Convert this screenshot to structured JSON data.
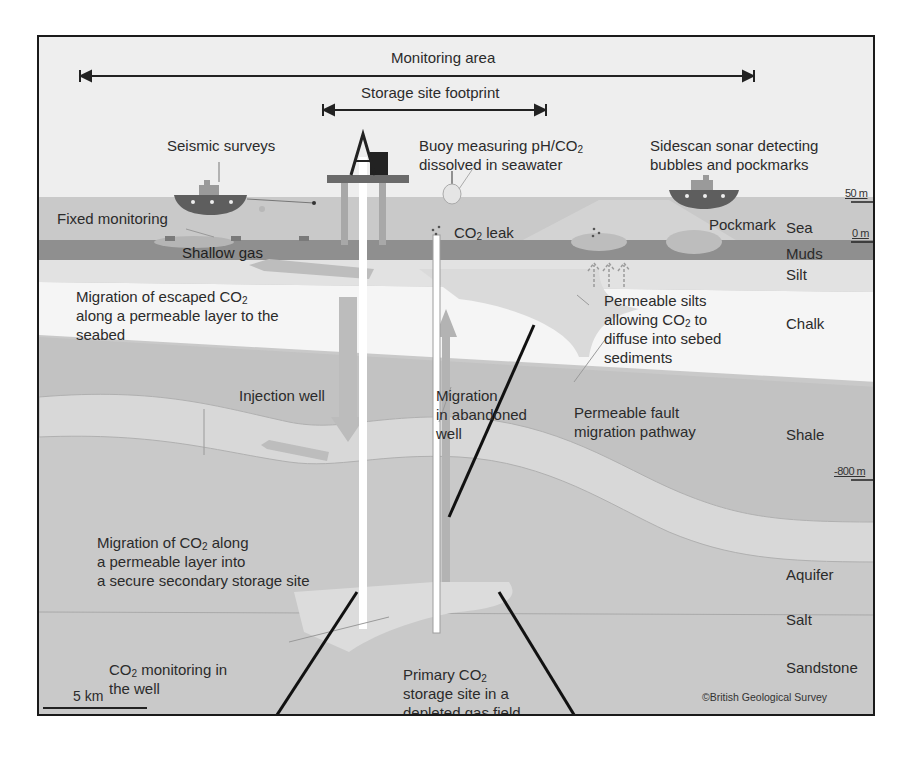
{
  "diagram": {
    "spans": [
      {
        "id": "monitoring-area",
        "label": "Monitoring area"
      },
      {
        "id": "storage-footprint",
        "label": "Storage site footprint"
      }
    ],
    "callouts": {
      "seismic": "Seismic surveys",
      "buoy_line1": "Buoy measuring pH/CO",
      "buoy_sub": "2",
      "buoy_line2": "dissolved in seawater",
      "sidescan_line1": "Sidescan sonar detecting",
      "sidescan_line2": "bubbles and pockmarks",
      "fixed": "Fixed monitoring",
      "shallow_gas": "Shallow gas",
      "leak_pre": "CO",
      "leak_sub": "2",
      "leak_post": " leak",
      "pockmark": "Pockmark",
      "escaped_line1_pre": "Migration of escaped CO",
      "escaped_sub": "2",
      "escaped_line2": "along a permeable layer to the",
      "escaped_line3": "seabed",
      "silts_line1": "Permeable silts",
      "silts_line2_pre": "allowing CO",
      "silts_sub": "2",
      "silts_line2_post": " to",
      "silts_line3": "diffuse into sebed",
      "silts_line4": "sediments",
      "injection": "Injection well",
      "abandoned_line1": "Migration",
      "abandoned_line2": "in abandoned",
      "abandoned_line3": "well",
      "fault_line1": "Permeable fault",
      "fault_line2": "migration pathway",
      "secondary_line1_pre": "Migration of CO",
      "secondary_sub": "2",
      "secondary_line1_post": " along",
      "secondary_line2": "a permeable layer into",
      "secondary_line3": "a secure secondary storage site",
      "monitor_well_pre": "CO",
      "monitor_well_sub": "2",
      "monitor_well_post": " monitoring in",
      "monitor_well_line2": "the well",
      "primary_line1_pre": "Primary CO",
      "primary_sub": "2",
      "primary_line2": "storage site in a",
      "primary_line3": "depleted gas field"
    },
    "layers": [
      "Sea",
      "Muds",
      "Silt",
      "Chalk",
      "Shale",
      "Aquifer",
      "Salt",
      "Sandstone"
    ],
    "depth_markers": [
      "50 m",
      "0 m",
      "-800 m"
    ],
    "scale_bar": "5 km",
    "copyright": "©British Geological Survey",
    "colors": {
      "sky": "#efefef",
      "sea": "#c8c8c8",
      "muds": "#8e8e8e",
      "silt": "#e3e3e3",
      "chalk": "#f6f6f6",
      "shale": "#c3c3c3",
      "aquifer": "#d9d9d9",
      "salt": "#c6c6c6",
      "sandstone": "#c9c9c9",
      "storage": "#dcdcdc",
      "ship": "#5e5e5e",
      "fault": "#111111"
    }
  }
}
